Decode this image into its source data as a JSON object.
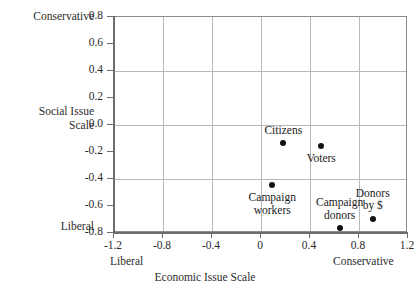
{
  "chart_data": {
    "type": "scatter",
    "title": "",
    "xlabel": "Economic Issue Scale",
    "ylabel": "Social Issue Scale",
    "xlim": [
      -1.2,
      1.2
    ],
    "ylim": [
      -0.8,
      0.8
    ],
    "xticks": [
      "-1.2",
      "-0.8",
      "-0.4",
      "0",
      "0.4",
      "0.8",
      "1.2"
    ],
    "xtick_values": [
      -1.2,
      -0.8,
      -0.4,
      0,
      0.4,
      0.8,
      1.2
    ],
    "yticks": [
      "0.8",
      "0.6",
      "0.4",
      "0.2",
      "0.0",
      "-0.2",
      "-0.4",
      "-0.6",
      "-0.8"
    ],
    "ytick_values": [
      0.8,
      0.6,
      0.4,
      0.2,
      0.0,
      -0.2,
      -0.4,
      -0.6,
      -0.8
    ],
    "grid": true,
    "legend": "none",
    "x_axis_low_anchor": "Liberal",
    "x_axis_high_anchor": "Conservative",
    "y_axis_low_anchor": "Liberal",
    "y_axis_high_anchor": "Conservative",
    "points": [
      {
        "label": "Citizens",
        "x": 0.19,
        "y": -0.14,
        "label_pos": "above"
      },
      {
        "label": "Voters",
        "x": 0.5,
        "y": -0.16,
        "label_pos": "below"
      },
      {
        "label": "Campaign\nworkers",
        "label_line1": "Campaign",
        "label_line2": "workers",
        "x": 0.1,
        "y": -0.45,
        "label_pos": "below"
      },
      {
        "label": "Campaign\ndonors",
        "label_line1": "Campaign",
        "label_line2": "donors",
        "x": 0.65,
        "y": -0.77,
        "label_pos": "above"
      },
      {
        "label": "Donors\nby $",
        "label_line1": "Donors",
        "label_line2": "by $",
        "x": 0.92,
        "y": -0.7,
        "label_pos": "above"
      }
    ]
  },
  "axes": {
    "y_title_line1": "Social Issue",
    "y_title_line2": "Scale",
    "y_top_anchor": "Conservative",
    "y_bottom_anchor": "Liberal",
    "x_title": "Economic Issue Scale",
    "x_left_anchor": "Liberal",
    "x_right_anchor": "Conservative"
  },
  "ticks": {
    "y": [
      "0.8",
      "0.6",
      "0.4",
      "0.2",
      "0.0",
      "-0.2",
      "-0.4",
      "-0.6",
      "-0.8"
    ],
    "x": [
      "-1.2",
      "-0.8",
      "-0.4",
      "0",
      "0.4",
      "0.8",
      "1.2"
    ]
  },
  "colors": {
    "marker": "#111111",
    "grid": "#b8b8b8",
    "spine": "#6e6e6e",
    "text": "#2b2b2b",
    "background": "#ffffff"
  }
}
